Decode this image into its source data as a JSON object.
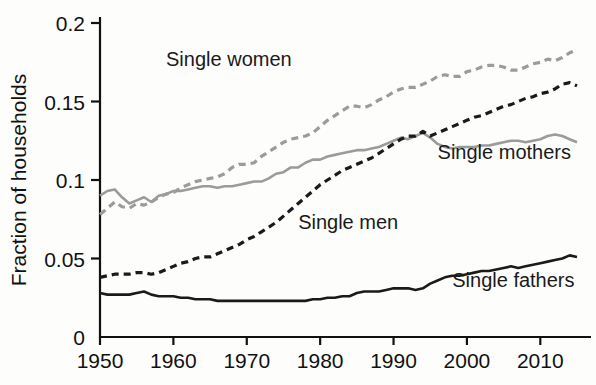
{
  "chart_data": {
    "type": "line",
    "title": "",
    "xlabel": "",
    "ylabel": "Fraction of households",
    "xlim": [
      1950,
      2015
    ],
    "ylim": [
      0,
      0.2
    ],
    "xticks": [
      1950,
      1960,
      1970,
      1980,
      1990,
      2000,
      2010
    ],
    "xtick_labels": [
      "1950",
      "1960",
      "1970",
      "1980",
      "1990",
      "2000",
      "2010"
    ],
    "yticks": [
      0,
      0.05,
      0.1,
      0.15,
      0.2
    ],
    "ytick_labels": [
      "0",
      "0.05",
      "0.1",
      "0.15",
      "0.2"
    ],
    "grid": false,
    "legend_position": "inline-annotations",
    "x": [
      1950,
      1951,
      1952,
      1953,
      1954,
      1955,
      1956,
      1957,
      1958,
      1959,
      1960,
      1961,
      1962,
      1963,
      1964,
      1965,
      1966,
      1967,
      1968,
      1969,
      1970,
      1971,
      1972,
      1973,
      1974,
      1975,
      1976,
      1977,
      1978,
      1979,
      1980,
      1981,
      1982,
      1983,
      1984,
      1985,
      1986,
      1987,
      1988,
      1989,
      1990,
      1991,
      1992,
      1993,
      1994,
      1995,
      1996,
      1997,
      1998,
      1999,
      2000,
      2001,
      2002,
      2003,
      2004,
      2005,
      2006,
      2007,
      2008,
      2009,
      2010,
      2011,
      2012,
      2013,
      2014,
      2015
    ],
    "series": [
      {
        "name": "Single women",
        "color": "#9b9b9b",
        "style": "dashed",
        "label": "Single women",
        "label_x": 1959,
        "label_y": 0.177,
        "values": [
          0.078,
          0.082,
          0.086,
          0.083,
          0.082,
          0.085,
          0.084,
          0.086,
          0.089,
          0.091,
          0.092,
          0.095,
          0.097,
          0.099,
          0.1,
          0.101,
          0.102,
          0.104,
          0.108,
          0.11,
          0.11,
          0.111,
          0.115,
          0.118,
          0.121,
          0.124,
          0.126,
          0.127,
          0.128,
          0.13,
          0.134,
          0.138,
          0.141,
          0.144,
          0.147,
          0.147,
          0.146,
          0.148,
          0.151,
          0.153,
          0.156,
          0.158,
          0.159,
          0.159,
          0.161,
          0.163,
          0.166,
          0.167,
          0.166,
          0.166,
          0.169,
          0.17,
          0.172,
          0.173,
          0.173,
          0.172,
          0.17,
          0.17,
          0.172,
          0.174,
          0.175,
          0.177,
          0.176,
          0.178,
          0.181,
          0.183
        ]
      },
      {
        "name": "Single mothers",
        "color": "#9b9b9b",
        "style": "solid",
        "label": "Single mothers",
        "label_x": 1996,
        "label_y": 0.118,
        "values": [
          0.09,
          0.093,
          0.094,
          0.089,
          0.085,
          0.087,
          0.089,
          0.086,
          0.09,
          0.091,
          0.093,
          0.093,
          0.094,
          0.095,
          0.096,
          0.096,
          0.095,
          0.096,
          0.096,
          0.097,
          0.098,
          0.099,
          0.099,
          0.101,
          0.104,
          0.105,
          0.108,
          0.108,
          0.111,
          0.113,
          0.113,
          0.115,
          0.116,
          0.117,
          0.118,
          0.119,
          0.119,
          0.12,
          0.121,
          0.123,
          0.125,
          0.127,
          0.126,
          0.128,
          0.13,
          0.127,
          0.123,
          0.121,
          0.12,
          0.121,
          0.121,
          0.121,
          0.122,
          0.122,
          0.123,
          0.124,
          0.125,
          0.125,
          0.124,
          0.125,
          0.126,
          0.128,
          0.129,
          0.128,
          0.126,
          0.124
        ]
      },
      {
        "name": "Single men",
        "color": "#1a1a1a",
        "style": "dashed",
        "label": "Single men",
        "label_x": 1977,
        "label_y": 0.073,
        "values": [
          0.038,
          0.039,
          0.04,
          0.04,
          0.04,
          0.041,
          0.041,
          0.04,
          0.041,
          0.043,
          0.045,
          0.047,
          0.048,
          0.05,
          0.051,
          0.051,
          0.053,
          0.055,
          0.057,
          0.059,
          0.062,
          0.064,
          0.067,
          0.07,
          0.073,
          0.077,
          0.081,
          0.085,
          0.089,
          0.093,
          0.097,
          0.1,
          0.103,
          0.106,
          0.108,
          0.11,
          0.112,
          0.114,
          0.117,
          0.12,
          0.123,
          0.126,
          0.128,
          0.128,
          0.131,
          0.128,
          0.13,
          0.132,
          0.134,
          0.136,
          0.138,
          0.14,
          0.141,
          0.143,
          0.145,
          0.147,
          0.148,
          0.15,
          0.152,
          0.153,
          0.155,
          0.156,
          0.158,
          0.161,
          0.162,
          0.16
        ]
      },
      {
        "name": "Single fathers",
        "color": "#1a1a1a",
        "style": "solid",
        "label": "Single fathers",
        "label_x": 1998,
        "label_y": 0.036,
        "values": [
          0.028,
          0.027,
          0.027,
          0.027,
          0.027,
          0.028,
          0.029,
          0.027,
          0.026,
          0.026,
          0.026,
          0.025,
          0.025,
          0.024,
          0.024,
          0.024,
          0.023,
          0.023,
          0.023,
          0.023,
          0.023,
          0.023,
          0.023,
          0.023,
          0.023,
          0.023,
          0.023,
          0.023,
          0.023,
          0.024,
          0.024,
          0.025,
          0.025,
          0.026,
          0.026,
          0.028,
          0.029,
          0.029,
          0.029,
          0.03,
          0.031,
          0.031,
          0.031,
          0.03,
          0.031,
          0.034,
          0.036,
          0.038,
          0.039,
          0.039,
          0.04,
          0.041,
          0.042,
          0.042,
          0.043,
          0.044,
          0.045,
          0.044,
          0.045,
          0.046,
          0.047,
          0.048,
          0.049,
          0.05,
          0.052,
          0.051
        ]
      }
    ]
  }
}
